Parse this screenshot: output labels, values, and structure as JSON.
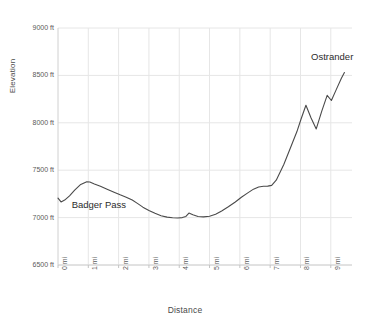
{
  "chart_data": {
    "type": "line",
    "title": "",
    "xlabel": "Distance",
    "ylabel": "Elevation",
    "xlim": [
      0,
      9.7
    ],
    "ylim": [
      6500,
      9000
    ],
    "grid": true,
    "legend": false,
    "x_tick_labels": [
      "0 mi",
      "1 mi",
      "2 mi",
      "3 mi",
      "4 mi",
      "5 mi",
      "6 mi",
      "7 mi",
      "8 mi",
      "9 mi"
    ],
    "x_tick_values": [
      0,
      1,
      2,
      3,
      4,
      5,
      6,
      7,
      8,
      9
    ],
    "y_tick_labels": [
      "6500 ft",
      "7000 ft",
      "7500 ft",
      "8000 ft",
      "8500 ft",
      "9000 ft"
    ],
    "y_tick_values": [
      6500,
      7000,
      7500,
      8000,
      8500,
      9000
    ],
    "series": [
      {
        "name": "Elevation profile",
        "color": "#4a4a4a",
        "x": [
          0.0,
          0.1,
          0.22,
          0.38,
          0.55,
          0.75,
          0.95,
          1.05,
          1.2,
          1.4,
          1.62,
          1.85,
          2.05,
          2.25,
          2.45,
          2.62,
          2.8,
          3.0,
          3.2,
          3.4,
          3.6,
          3.78,
          3.95,
          4.1,
          4.22,
          4.32,
          4.45,
          4.62,
          4.8,
          5.0,
          5.2,
          5.4,
          5.62,
          5.85,
          6.05,
          6.25,
          6.45,
          6.62,
          6.78,
          6.92,
          7.05,
          7.2,
          7.45,
          7.7,
          7.88,
          8.02,
          8.18,
          8.35,
          8.52,
          8.7,
          8.88,
          9.02,
          9.18,
          9.35,
          9.45
        ],
        "y": [
          7205,
          7165,
          7185,
          7230,
          7290,
          7350,
          7378,
          7375,
          7355,
          7330,
          7300,
          7268,
          7240,
          7215,
          7185,
          7150,
          7110,
          7075,
          7045,
          7020,
          7005,
          6998,
          6995,
          7000,
          7012,
          7048,
          7030,
          7012,
          7008,
          7015,
          7035,
          7070,
          7115,
          7165,
          7215,
          7258,
          7300,
          7322,
          7330,
          7332,
          7340,
          7395,
          7560,
          7760,
          7905,
          8040,
          8185,
          8050,
          7935,
          8120,
          8290,
          8235,
          8350,
          8470,
          8530
        ]
      }
    ],
    "annotations": [
      {
        "text": "Badger Pass",
        "x": 0.45,
        "y": 7120
      },
      {
        "text": "Ostrander",
        "x": 8.35,
        "y": 8680
      }
    ]
  }
}
